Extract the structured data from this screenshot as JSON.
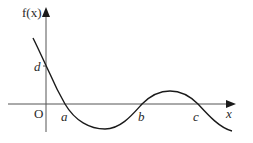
{
  "diagram": {
    "y_axis_label": "f(x)",
    "x_axis_label": "x",
    "origin_label": "O",
    "y_intercept_label": "d",
    "roots": [
      "a",
      "b",
      "c"
    ],
    "colors": {
      "axes": "#555555",
      "curve": "#1a1a1a",
      "text": "#2a2a2a",
      "background": "#ffffff"
    }
  }
}
